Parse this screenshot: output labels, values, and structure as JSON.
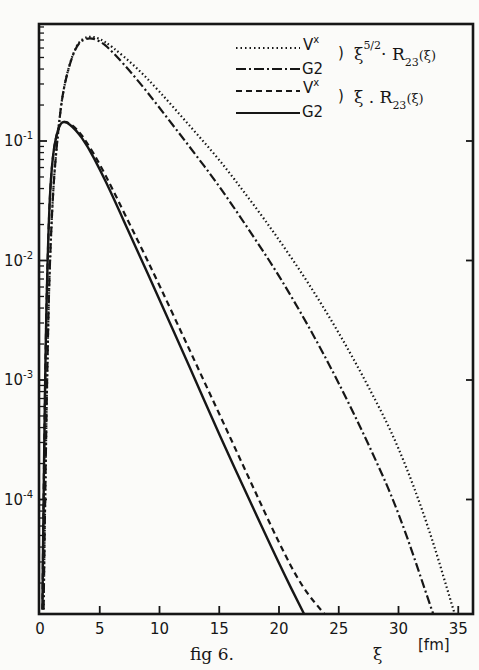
{
  "chart_data": {
    "type": "line",
    "title": "",
    "caption": "fig 6.",
    "xlabel": "ξ",
    "xunit": "[fm]",
    "ylabel": "",
    "xlim": [
      0,
      35
    ],
    "ylim": [
      1.1e-05,
      1.0
    ],
    "yscale": "log",
    "grid": false,
    "legend_position": "upper right",
    "x_ticks": [
      0,
      5,
      10,
      15,
      20,
      25,
      30,
      35
    ],
    "x_tick_labels": [
      "0",
      "5",
      "10",
      "15",
      "20",
      "25",
      "30",
      "35"
    ],
    "y_ticks": [
      0.1,
      0.01,
      0.001,
      0.0001
    ],
    "y_tick_labels": [
      {
        "base": "10",
        "exp": "-1"
      },
      {
        "base": "10",
        "exp": "-2"
      },
      {
        "base": "10",
        "exp": "-3"
      },
      {
        "base": "10",
        "exp": "-4"
      }
    ],
    "legend": [
      {
        "style": "dotted",
        "label": "Vˣ",
        "group": "ξ^(5/2) · R23(ξ)"
      },
      {
        "style": "dashdot",
        "label": "G2",
        "group": "ξ^(5/2) · R23(ξ)"
      },
      {
        "style": "dashed",
        "label": "Vˣ",
        "group": "ξ · R23(ξ)"
      },
      {
        "style": "solid",
        "label": "G2",
        "group": "ξ · R23(ξ)"
      }
    ],
    "series": [
      {
        "name": "Vx ξ^5/2 R23(ξ)",
        "style": "dotted",
        "x": [
          0.3,
          0.6,
          1.0,
          1.5,
          2.0,
          3.0,
          4.0,
          5.0,
          6.0,
          8.0,
          10.0,
          12.5,
          15.0,
          17.5,
          20.0,
          22.5,
          25.0,
          27.5,
          30.0,
          32.5,
          34.7
        ],
        "y": [
          1.2e-05,
          0.002,
          0.03,
          0.12,
          0.3,
          0.65,
          0.76,
          0.72,
          0.62,
          0.42,
          0.26,
          0.135,
          0.07,
          0.033,
          0.015,
          0.0064,
          0.0025,
          0.00088,
          0.00028,
          6e-05,
          1.1e-05
        ]
      },
      {
        "name": "G2 ξ^5/2 R23(ξ)",
        "style": "dashdot",
        "x": [
          0.3,
          0.6,
          1.0,
          1.5,
          2.0,
          3.0,
          4.0,
          5.0,
          6.0,
          8.0,
          10.0,
          12.5,
          15.0,
          17.5,
          20.0,
          22.5,
          25.0,
          27.5,
          30.0,
          32.9
        ],
        "y": [
          1.2e-05,
          0.002,
          0.03,
          0.12,
          0.3,
          0.64,
          0.74,
          0.69,
          0.57,
          0.34,
          0.19,
          0.09,
          0.042,
          0.018,
          0.0075,
          0.0028,
          0.00095,
          0.00029,
          8e-05,
          1.1e-05
        ]
      },
      {
        "name": "Vx ξ R23(ξ)",
        "style": "dashed",
        "x": [
          0.2,
          0.4,
          0.7,
          1.0,
          1.5,
          2.0,
          3.0,
          4.0,
          5.0,
          6.0,
          8.0,
          10.0,
          12.5,
          15.0,
          17.5,
          20.0,
          22.0,
          23.8
        ],
        "y": [
          1.2e-05,
          0.001,
          0.02,
          0.07,
          0.13,
          0.15,
          0.13,
          0.095,
          0.064,
          0.041,
          0.016,
          0.0062,
          0.0018,
          0.00052,
          0.00015,
          4.3e-05,
          1.8e-05,
          1.1e-05
        ]
      },
      {
        "name": "G2 ξ R23(ξ)",
        "style": "solid",
        "x": [
          0.2,
          0.4,
          0.7,
          1.0,
          1.5,
          2.0,
          3.0,
          4.0,
          5.0,
          6.0,
          8.0,
          10.0,
          12.5,
          15.0,
          17.5,
          20.0,
          22.1
        ],
        "y": [
          1.2e-05,
          0.001,
          0.02,
          0.07,
          0.13,
          0.15,
          0.125,
          0.09,
          0.058,
          0.036,
          0.013,
          0.0047,
          0.0013,
          0.00035,
          0.0001,
          2.9e-05,
          1.1e-05
        ]
      }
    ]
  },
  "legend_text": {
    "row1_label": "V",
    "row1_sup": "x",
    "row2_label": "G2",
    "group1_expr": "ξ",
    "group1_sup": "5/2",
    "group1_rest": "· R",
    "group1_sub": "23",
    "group1_arg": "(ξ)",
    "row3_label": "V",
    "row3_sup": "x",
    "row4_label": "G2",
    "group2_expr": "ξ . R",
    "group2_sub": "23",
    "group2_arg": "(ξ)",
    "paren": ")"
  },
  "axis_text": {
    "x_symbol": "ξ",
    "x_unit": "[fm]",
    "caption": "fig 6."
  }
}
